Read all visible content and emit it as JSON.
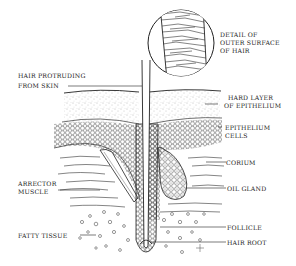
{
  "diagram": {
    "labels": {
      "detail_line1": "DETAIL OF",
      "detail_line2": "OUTER SURFACE",
      "detail_line3": "OF HAIR",
      "protruding_line1": "HAIR PROTRUDING",
      "protruding_line2": "FROM SKIN",
      "hard_layer_line1": "HARD LAYER",
      "hard_layer_line2": "OF EPITHELIUM",
      "epithelium_line1": "EPITHELIUM",
      "epithelium_line2": "CELLS",
      "corium": "CORIUM",
      "arrector_line1": "ARRECTOR",
      "arrector_line2": "MUSCLE",
      "oil_gland": "OIL GLAND",
      "fatty_tissue": "FATTY TISSUE",
      "follicle": "FOLLICLE",
      "hair_root": "HAIR ROOT"
    },
    "colors": {
      "ink": "#222222",
      "stipple": "#777777",
      "background": "#ffffff"
    }
  }
}
